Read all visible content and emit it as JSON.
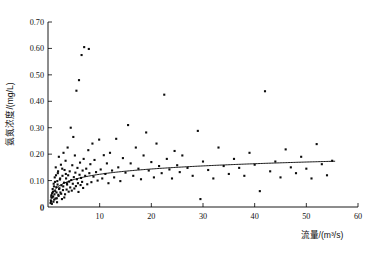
{
  "chart_data": {
    "type": "scatter",
    "title": "",
    "xlabel": "流量/(m³/s)",
    "ylabel": "氨氮浓度/(mg/L)",
    "xlim": [
      0,
      60
    ],
    "ylim": [
      0,
      0.7
    ],
    "grid": false,
    "legend": null,
    "xticks": [
      0,
      10,
      20,
      30,
      40,
      50,
      60
    ],
    "xtick_labels": [
      "0",
      "10",
      "20",
      "30",
      "40",
      "50",
      "60"
    ],
    "yticks": [
      0,
      0.1,
      0.2,
      0.3,
      0.4,
      0.5,
      0.6,
      0.7
    ],
    "ytick_labels": [
      "0",
      "0.10",
      "0.20",
      "0.30",
      "0.40",
      "0.50",
      "0.60",
      "0.70"
    ],
    "marker": "square",
    "marker_color": "#0d0d0d",
    "marker_size": 2.1,
    "series": [
      {
        "name": "observations",
        "points": [
          [
            0.6,
            0.021
          ],
          [
            0.7,
            0.035
          ],
          [
            0.8,
            0.052
          ],
          [
            0.9,
            0.068
          ],
          [
            1.0,
            0.04
          ],
          [
            1.1,
            0.088
          ],
          [
            1.2,
            0.028
          ],
          [
            1.3,
            0.112
          ],
          [
            1.4,
            0.06
          ],
          [
            1.5,
            0.15
          ],
          [
            1.6,
            0.075
          ],
          [
            1.7,
            0.033
          ],
          [
            1.8,
            0.098
          ],
          [
            1.9,
            0.128
          ],
          [
            2.0,
            0.046
          ],
          [
            2.1,
            0.19
          ],
          [
            2.2,
            0.071
          ],
          [
            2.3,
            0.104
          ],
          [
            2.4,
            0.055
          ],
          [
            2.5,
            0.16
          ],
          [
            2.6,
            0.082
          ],
          [
            2.7,
            0.03
          ],
          [
            2.8,
            0.118
          ],
          [
            2.9,
            0.064
          ],
          [
            3.0,
            0.205
          ],
          [
            3.1,
            0.092
          ],
          [
            3.2,
            0.14
          ],
          [
            3.3,
            0.048
          ],
          [
            3.4,
            0.175
          ],
          [
            3.5,
            0.108
          ],
          [
            3.6,
            0.066
          ],
          [
            3.7,
            0.085
          ],
          [
            3.8,
            0.225
          ],
          [
            3.9,
            0.12
          ],
          [
            4.0,
            0.058
          ],
          [
            4.1,
            0.096
          ],
          [
            4.2,
            0.135
          ],
          [
            4.3,
            0.074
          ],
          [
            4.4,
            0.3
          ],
          [
            4.5,
            0.102
          ],
          [
            4.6,
            0.062
          ],
          [
            4.7,
            0.158
          ],
          [
            4.8,
            0.088
          ],
          [
            4.9,
            0.265
          ],
          [
            5.0,
            0.113
          ],
          [
            5.1,
            0.07
          ],
          [
            5.2,
            0.195
          ],
          [
            5.3,
            0.13
          ],
          [
            5.4,
            0.079
          ],
          [
            5.5,
            0.44
          ],
          [
            5.6,
            0.105
          ],
          [
            5.7,
            0.148
          ],
          [
            5.8,
            0.09
          ],
          [
            5.9,
            0.057
          ],
          [
            6.0,
            0.48
          ],
          [
            6.1,
            0.122
          ],
          [
            6.2,
            0.168
          ],
          [
            6.3,
            0.083
          ],
          [
            6.4,
            0.11
          ],
          [
            6.5,
            0.575
          ],
          [
            6.6,
            0.095
          ],
          [
            6.7,
            0.138
          ],
          [
            6.8,
            0.072
          ],
          [
            6.9,
            0.182
          ],
          [
            7.0,
            0.605
          ],
          [
            7.2,
            0.118
          ],
          [
            7.4,
            0.145
          ],
          [
            7.6,
            0.086
          ],
          [
            7.8,
            0.215
          ],
          [
            7.9,
            0.598
          ],
          [
            8.0,
            0.128
          ],
          [
            8.2,
            0.162
          ],
          [
            8.4,
            0.094
          ],
          [
            8.6,
            0.24
          ],
          [
            8.8,
            0.115
          ],
          [
            9.0,
            0.178
          ],
          [
            9.3,
            0.132
          ],
          [
            9.6,
            0.1
          ],
          [
            9.9,
            0.255
          ],
          [
            10.2,
            0.142
          ],
          [
            10.5,
            0.108
          ],
          [
            10.8,
            0.196
          ],
          [
            11.1,
            0.125
          ],
          [
            11.4,
            0.165
          ],
          [
            11.7,
            0.09
          ],
          [
            12.0,
            0.205
          ],
          [
            12.4,
            0.138
          ],
          [
            12.8,
            0.112
          ],
          [
            13.2,
            0.258
          ],
          [
            13.6,
            0.15
          ],
          [
            14.0,
            0.098
          ],
          [
            14.5,
            0.185
          ],
          [
            15.0,
            0.13
          ],
          [
            15.5,
            0.31
          ],
          [
            16.0,
            0.165
          ],
          [
            16.5,
            0.118
          ],
          [
            17.0,
            0.225
          ],
          [
            17.5,
            0.145
          ],
          [
            18.0,
            0.105
          ],
          [
            18.5,
            0.195
          ],
          [
            19.0,
            0.282
          ],
          [
            19.5,
            0.138
          ],
          [
            20.0,
            0.17
          ],
          [
            20.5,
            0.112
          ],
          [
            21.0,
            0.24
          ],
          [
            21.5,
            0.155
          ],
          [
            22.0,
            0.128
          ],
          [
            22.5,
            0.425
          ],
          [
            23.0,
            0.182
          ],
          [
            23.5,
            0.142
          ],
          [
            24.0,
            0.108
          ],
          [
            24.5,
            0.212
          ],
          [
            25.0,
            0.158
          ],
          [
            25.5,
            0.132
          ],
          [
            26.0,
            0.195
          ],
          [
            27.0,
            0.148
          ],
          [
            28.0,
            0.118
          ],
          [
            29.0,
            0.288
          ],
          [
            29.5,
            0.03
          ],
          [
            30.0,
            0.172
          ],
          [
            31.0,
            0.14
          ],
          [
            32.0,
            0.108
          ],
          [
            33.0,
            0.225
          ],
          [
            34.0,
            0.155
          ],
          [
            35.0,
            0.125
          ],
          [
            36.0,
            0.182
          ],
          [
            37.0,
            0.148
          ],
          [
            38.0,
            0.118
          ],
          [
            39.0,
            0.205
          ],
          [
            40.0,
            0.16
          ],
          [
            41.0,
            0.06
          ],
          [
            42.0,
            0.438
          ],
          [
            43.0,
            0.135
          ],
          [
            44.0,
            0.172
          ],
          [
            45.0,
            0.112
          ],
          [
            46.0,
            0.218
          ],
          [
            47.0,
            0.15
          ],
          [
            48.0,
            0.128
          ],
          [
            49.0,
            0.19
          ],
          [
            50.0,
            0.145
          ],
          [
            51.0,
            0.108
          ],
          [
            52.0,
            0.238
          ],
          [
            53.0,
            0.162
          ],
          [
            54.0,
            0.12
          ],
          [
            55.0,
            0.175
          ],
          [
            0.5,
            0.015
          ],
          [
            0.55,
            0.025
          ],
          [
            0.65,
            0.044
          ],
          [
            0.75,
            0.012
          ],
          [
            0.85,
            0.038
          ],
          [
            0.95,
            0.058
          ],
          [
            1.05,
            0.02
          ],
          [
            1.15,
            0.078
          ],
          [
            1.25,
            0.048
          ],
          [
            1.35,
            0.095
          ],
          [
            1.45,
            0.032
          ],
          [
            1.55,
            0.12
          ],
          [
            1.65,
            0.055
          ],
          [
            1.75,
            0.018
          ],
          [
            1.85,
            0.085
          ],
          [
            1.95,
            0.135
          ],
          [
            2.05,
            0.042
          ],
          [
            2.15,
            0.068
          ],
          [
            2.35,
            0.108
          ],
          [
            2.55,
            0.05
          ],
          [
            2.75,
            0.145
          ],
          [
            2.95,
            0.078
          ],
          [
            3.15,
            0.036
          ],
          [
            3.45,
            0.125
          ],
          [
            3.65,
            0.09
          ]
        ]
      }
    ],
    "fit_curve": {
      "name": "logarithmic-fit",
      "equation_form": "y = a + b*ln(x)",
      "a": 0.0575,
      "b": 0.0288,
      "x_start": 0.5,
      "x_end": 55.5,
      "color": "#000000"
    }
  }
}
